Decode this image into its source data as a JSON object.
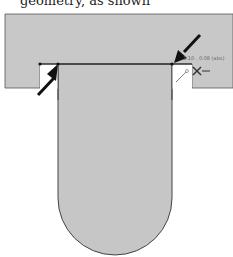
{
  "caption": {
    "text": "geometry, as shown"
  },
  "diagram": {
    "fill_color": "#c8c8c8",
    "outline_color": "#444444",
    "arrow_color": "#111111",
    "dimension_label": "1.10 , 0.08 (abs)",
    "markers": [
      "left-arrow",
      "right-arrow",
      "line-tool-icon",
      "move-cursor-icon"
    ]
  }
}
